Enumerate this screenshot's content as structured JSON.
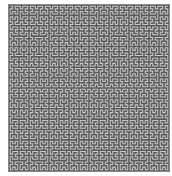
{
  "figure": {
    "type": "hilbert-curve",
    "order": 6,
    "colors": {
      "background": "#5a5a5a",
      "line": "#c8c8c8",
      "page": "#ffffff"
    }
  }
}
